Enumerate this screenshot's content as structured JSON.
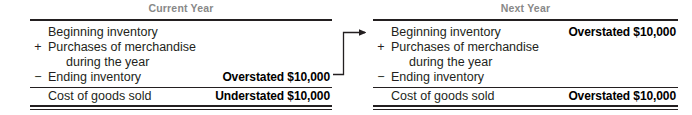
{
  "figure": {
    "panels": [
      {
        "key": "current_year",
        "title": "Current Year",
        "rows": [
          {
            "op": "",
            "label": "Beginning inventory",
            "amount": ""
          },
          {
            "op": "+",
            "label": "Purchases of merchandise",
            "amount": ""
          },
          {
            "op": "",
            "label": "during the year",
            "amount": ""
          },
          {
            "op": "−",
            "label": "Ending inventory",
            "amount": "Overstated $10,000"
          },
          {
            "op": "",
            "label": "Cost of goods sold",
            "amount": "Understated $10,000"
          }
        ]
      },
      {
        "key": "next_year",
        "title": "Next Year",
        "rows": [
          {
            "op": "",
            "label": "Beginning inventory",
            "amount": "Overstated $10,000"
          },
          {
            "op": "+",
            "label": "Purchases of merchandise",
            "amount": ""
          },
          {
            "op": "",
            "label": "during the year",
            "amount": ""
          },
          {
            "op": "−",
            "label": "Ending inventory",
            "amount": ""
          },
          {
            "op": "",
            "label": "Cost of goods sold",
            "amount": "Overstated $10,000"
          }
        ]
      }
    ],
    "connector": {
      "name": "flow-arrow",
      "from": "current_year.ending_inventory",
      "to": "next_year.beginning_inventory"
    },
    "colors": {
      "title": "#888888",
      "rule": "#231f20",
      "text": "#231f20",
      "amount": "#000000",
      "arrow": "#231f20"
    }
  }
}
